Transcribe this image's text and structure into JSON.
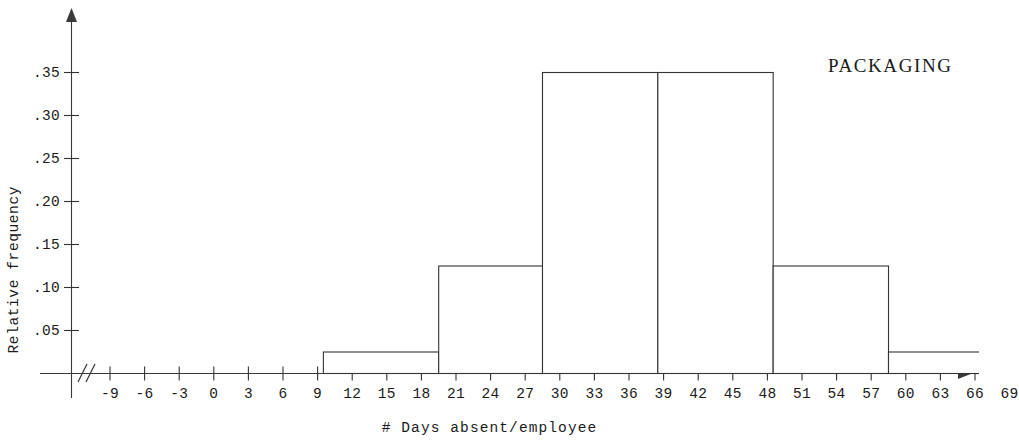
{
  "chart_data": {
    "type": "bar",
    "title": "",
    "annotation": "PACKAGING",
    "xlabel": "# Days absent/employee",
    "ylabel": "Relative frequency",
    "grid": false,
    "legend": "none",
    "xlim": [
      -10.5,
      70.5
    ],
    "ylim": [
      0,
      0.385
    ],
    "x_tick_labels": [
      "-9",
      "-6",
      "-3",
      "0",
      "3",
      "6",
      "9",
      "12",
      "15",
      "18",
      "21",
      "24",
      "27",
      "30",
      "33",
      "36",
      "39",
      "42",
      "45",
      "48",
      "51",
      "54",
      "57",
      "60",
      "63",
      "66",
      "69"
    ],
    "x_tick_values": [
      -9,
      -6,
      -3,
      0,
      3,
      6,
      9,
      12,
      15,
      18,
      21,
      24,
      27,
      30,
      33,
      36,
      39,
      42,
      45,
      48,
      51,
      54,
      57,
      60,
      63,
      66,
      69
    ],
    "y_tick_labels": [
      ".05",
      ".10",
      ".15",
      ".20",
      ".25",
      ".30",
      ".35"
    ],
    "y_tick_values": [
      0.05,
      0.1,
      0.15,
      0.2,
      0.25,
      0.3,
      0.35
    ],
    "axis_break": "//",
    "bin_edges": [
      9.5,
      19.5,
      28.5,
      38.5,
      48.5,
      58.5,
      69.0
    ],
    "bin_labels": [
      "9.5-19.5",
      "19.5-28.5",
      "28.5-38.5",
      "38.5-48.5",
      "48.5-58.5",
      "58.5-69.0"
    ],
    "values": [
      0.025,
      0.125,
      0.35,
      0.35,
      0.125,
      0.025
    ],
    "bar_color": "#ffffff",
    "bar_edge_color": "#333333",
    "axis_color": "#333333"
  },
  "axes": {
    "y_title": "Relative frequency",
    "x_title": "# Days absent/employee",
    "break_marker": "//"
  },
  "annotation": {
    "label": "PACKAGING"
  }
}
